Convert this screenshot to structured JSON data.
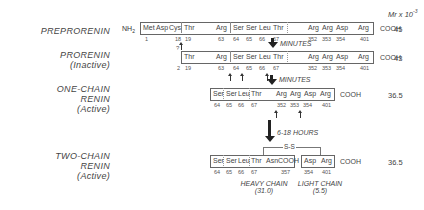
{
  "header": {
    "mr_label": "Mr x 10",
    "mr_exp": "-3"
  },
  "rows": [
    {
      "name": "PREPRORENIN",
      "sub": "",
      "mr": "45",
      "nh2": "NH",
      "nh2_sub": "2",
      "cooh": "COOH",
      "residues": [
        "Met",
        "Asp",
        "Cys",
        "Thr",
        "Arg",
        "Ser",
        "Ser",
        "Leu",
        "Thr",
        "Arg",
        "Arg",
        "Asp",
        "Arg"
      ],
      "numbers": [
        "1",
        "18",
        "19",
        "63",
        "64",
        "65",
        "66",
        "67",
        "352",
        "353",
        "354",
        "401"
      ],
      "cleavage_note": "?"
    },
    {
      "name": "PRORENIN",
      "sub": "(Inactive)",
      "mr": "43",
      "cooh": "COOH",
      "residues": [
        "Thr",
        "Arg",
        "Ser",
        "Ser",
        "Leu",
        "Thr",
        "Arg",
        "Arg",
        "Asp",
        "Arg"
      ],
      "numbers": [
        "19",
        "63",
        "64",
        "65",
        "66",
        "67",
        "352",
        "353",
        "354",
        "401"
      ],
      "start_note": "2"
    },
    {
      "name": "ONE-CHAIN",
      "name2": "RENIN",
      "sub": "(Active)",
      "mr": "36.5",
      "cooh": "COOH",
      "residues": [
        "Ser",
        "Ser",
        "Leu",
        "Thr",
        "Arg",
        "Arg",
        "Asp",
        "Arg"
      ],
      "numbers": [
        "64",
        "65",
        "66",
        "67",
        "352",
        "353",
        "354",
        "401"
      ]
    },
    {
      "name": "TWO-CHAIN",
      "name2": "RENIN",
      "sub": "(Active)",
      "mr": "36.5",
      "cooh": "COOH",
      "heavy_residues": [
        "Ser",
        "Ser",
        "Leu",
        "Thr",
        "AsnCOOH"
      ],
      "heavy_numbers": [
        "64",
        "65",
        "66",
        "67",
        "357"
      ],
      "light_residues": [
        "Asp",
        "Arg"
      ],
      "light_numbers": [
        "354",
        "401"
      ],
      "disulfide": "S-S",
      "heavy_label": "HEAVY CHAIN",
      "heavy_mr": "(31.0)",
      "light_label": "LIGHT CHAIN",
      "light_mr": "(5.5)"
    }
  ],
  "steps": [
    {
      "label": "MINUTES"
    },
    {
      "label": "MINUTES"
    },
    {
      "label": "6-18 HOURS"
    }
  ]
}
